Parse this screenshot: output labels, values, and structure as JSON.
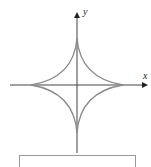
{
  "figure": {
    "curve": "astroid",
    "x_label": "x",
    "y_label": "y",
    "colors": {
      "curve": "#8a8a8a",
      "axis": "#333333"
    }
  }
}
